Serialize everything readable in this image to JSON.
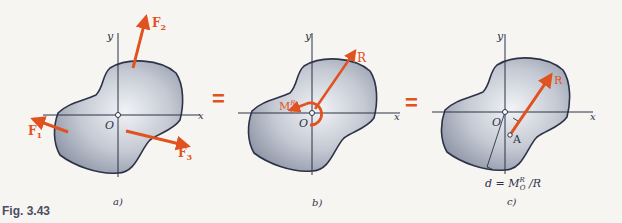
{
  "figure": {
    "caption": "Fig. 3.43",
    "colors": {
      "force": "#e0521f",
      "body_fill": "#b6bcc8",
      "outline": "#2d3347",
      "axis": "#2d3347",
      "background": "#f6f5f2"
    },
    "equals_sign": "=",
    "panels": [
      {
        "id": "a",
        "sublabel": "a)",
        "axes": {
          "x": "x",
          "y": "y",
          "origin": "O"
        },
        "forces": [
          {
            "label": "F",
            "sub": "1"
          },
          {
            "label": "F",
            "sub": "2"
          },
          {
            "label": "F",
            "sub": "3"
          }
        ]
      },
      {
        "id": "b",
        "sublabel": "b)",
        "axes": {
          "x": "x",
          "y": "y",
          "origin": "O"
        },
        "resultant": "R",
        "moment": {
          "label": "M",
          "sup": "R",
          "sub": "O"
        }
      },
      {
        "id": "c",
        "sublabel": "c)",
        "axes": {
          "x": "x",
          "y": "y",
          "origin": "O"
        },
        "resultant": "R",
        "point": "A",
        "distance_formula": {
          "lhs": "d = M",
          "sup": "R",
          "sub": "O",
          "rhs": " /R"
        }
      }
    ]
  }
}
